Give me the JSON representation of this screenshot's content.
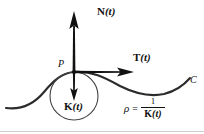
{
  "figure": {
    "background_color": "#ffffff",
    "ink_color": "#111111",
    "border_color": "#cccccc"
  },
  "labels": {
    "normal_vector": {
      "symbol": "N",
      "argument": "(t)"
    },
    "tangent_vector": {
      "symbol": "T",
      "argument": "(t)"
    },
    "curvature_vector": {
      "symbol": "K",
      "argument": "(t)"
    },
    "point": "P",
    "curve": "C"
  },
  "equation": {
    "rho_symbol": "ρ",
    "equals": "=",
    "numerator": "1",
    "denominator_symbol": "K",
    "denominator_argument": "(t)"
  },
  "geometry": {
    "point_P": {
      "x": 74,
      "y": 72
    },
    "circle": {
      "cx": 74,
      "cy": 96,
      "r": 24
    },
    "normal_arrow": {
      "x1": 74,
      "y1": 72,
      "x2": 74,
      "y2": 14
    },
    "tangent_arrow": {
      "x1": 74,
      "y1": 72,
      "x2": 131,
      "y2": 72
    },
    "curvature_arrow": {
      "x1": 74,
      "y1": 72,
      "x2": 74,
      "y2": 99
    }
  }
}
